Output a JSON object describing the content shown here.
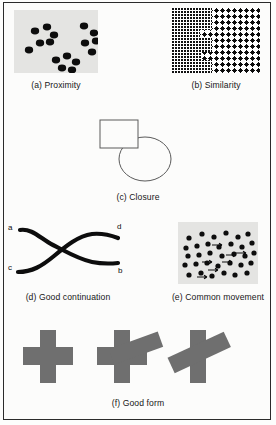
{
  "figure": {
    "border_color": "#2b2b2b",
    "background": "#fcfcfb",
    "panel_fill": "#e4e4e2",
    "dot_color": "#0d0d0d",
    "shape_gray": "#6f6f6f",
    "outline_color": "#5a5a5a"
  },
  "panels": [
    {
      "id": "proximity",
      "caption": "(a) Proximity",
      "type": "dot-clusters",
      "box": {
        "x": 14,
        "y": 10,
        "w": 84,
        "h": 63
      },
      "clusters": [
        {
          "name": "upper-left",
          "dots": [
            [
              21,
              21
            ],
            [
              33,
              17
            ],
            [
              40,
              25
            ],
            [
              26,
              33
            ],
            [
              36,
              33
            ],
            [
              17,
              40
            ]
          ]
        },
        {
          "name": "upper-right",
          "dots": [
            [
              73,
              17
            ],
            [
              83,
              25
            ],
            [
              76,
              34
            ],
            [
              86,
              32
            ],
            [
              82,
              42
            ]
          ]
        },
        {
          "name": "lower-center",
          "dots": [
            [
              42,
              51
            ],
            [
              54,
              47
            ],
            [
              62,
              53
            ],
            [
              48,
              59
            ],
            [
              58,
              62
            ]
          ]
        }
      ],
      "dot_radius": 3.6
    },
    {
      "id": "similarity",
      "caption": "(b) Similarity",
      "type": "texture-regions",
      "box": {
        "x": 172,
        "y": 8,
        "w": 88,
        "h": 65
      },
      "regions": [
        {
          "name": "fine-texture-left",
          "cell": 3,
          "dot": 1.4
        },
        {
          "name": "coarse-texture-right",
          "cell": 6,
          "dot": 3.0
        }
      ],
      "boundary": "stepped"
    },
    {
      "id": "closure",
      "caption": "(c) Closure",
      "type": "outline-shapes",
      "shapes": [
        {
          "name": "square",
          "x": 100,
          "y": 120,
          "w": 38,
          "h": 27
        },
        {
          "name": "circle",
          "cx": 145,
          "cy": 158,
          "rx": 25,
          "ry": 22
        }
      ]
    },
    {
      "id": "good-continuation",
      "caption": "(d) Good continuation",
      "type": "crossing-curves",
      "endpoint_labels": [
        "a",
        "d",
        "c",
        "b"
      ],
      "curves": [
        {
          "name": "curve-a-to-b",
          "from": "a",
          "to": "b"
        },
        {
          "name": "curve-c-to-d",
          "from": "c",
          "to": "d"
        }
      ]
    },
    {
      "id": "common-movement",
      "caption": "(e) Common movement",
      "type": "dots-with-motion-arrows",
      "box": {
        "x": 178,
        "y": 222,
        "w": 80,
        "h": 62
      },
      "dot_count": 40,
      "arrow_count": 7,
      "arrow_direction": "right"
    },
    {
      "id": "good-form",
      "caption": "(f) Good form",
      "type": "overlapping-bars",
      "figures": [
        {
          "name": "plain-cross",
          "rotation_deg": 0,
          "has_overlay_bar": false
        },
        {
          "name": "cross-with-tilted-bar",
          "rotation_deg": -22,
          "has_overlay_bar": true
        },
        {
          "name": "bar-with-steep-tilted-bar",
          "rotation_deg": -28,
          "has_overlay_bar": true
        }
      ]
    }
  ],
  "captions": {
    "a": "(a) Proximity",
    "b": "(b) Similarity",
    "c": "(c) Closure",
    "d": "(d) Good continuation",
    "e": "(e) Common movement",
    "f": "(f) Good form"
  },
  "labels": {
    "a": "a",
    "b": "b",
    "c": "c",
    "d": "d"
  }
}
